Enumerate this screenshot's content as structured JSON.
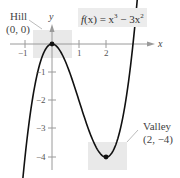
{
  "chart_data": {
    "type": "line",
    "title": "",
    "function_label": "f(x) = x^3 - 3x^2",
    "xlabel": "x",
    "ylabel": "y",
    "xlim": [
      -1.9,
      4.3
    ],
    "ylim": [
      -4.7,
      1.55
    ],
    "x_ticks": [
      -1,
      1,
      2
    ],
    "y_ticks": [
      -1,
      -2,
      -3,
      -4
    ],
    "series": [
      {
        "name": "f(x) = x^3 - 3x^2",
        "x": [
          -1.15,
          -1,
          -0.5,
          0,
          0.5,
          1,
          1.5,
          2,
          2.5,
          3,
          3.2
        ],
        "y": [
          -5.49,
          -4,
          -0.875,
          0,
          -0.625,
          -2,
          -3.375,
          -4,
          -3.125,
          0,
          2.05
        ]
      }
    ],
    "annotations": [
      {
        "label": "Hill",
        "coords": "(0, 0)",
        "x": 0,
        "y": 0
      },
      {
        "label": "Valley",
        "coords": "(2, −4)",
        "x": 2,
        "y": -4
      }
    ],
    "grid": false,
    "legend": "none"
  },
  "labels": {
    "hill": "Hill",
    "hill_coords": "(0, 0)",
    "valley": "Valley",
    "valley_coords": "(2, −4)",
    "x_axis": "x",
    "y_axis": "y",
    "tick_x_neg1": "−1",
    "tick_x_1": "1",
    "tick_x_2": "2",
    "tick_y_neg1": "−1",
    "tick_y_neg2": "−2",
    "tick_y_neg3": "−3",
    "tick_y_neg4": "−4",
    "func_f": "f",
    "func_paren": "(x) = x",
    "func_exp1": "3",
    "func_minus": " − 3x",
    "func_exp2": "2"
  },
  "colors": {
    "curve": "#111111",
    "axis": "#999999",
    "shade": "#e8e8e8"
  }
}
